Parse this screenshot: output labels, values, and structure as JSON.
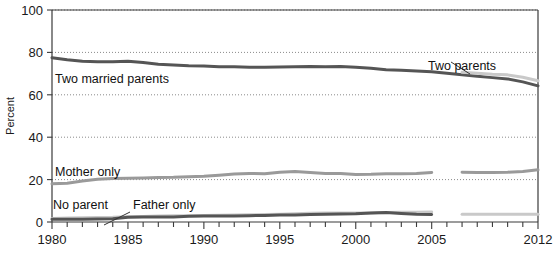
{
  "chart_data": {
    "type": "line",
    "title": "",
    "xlabel": "",
    "ylabel": "Percent",
    "xlim": [
      1980,
      2012
    ],
    "ylim": [
      0,
      100
    ],
    "yticks": [
      0,
      20,
      40,
      60,
      80,
      100
    ],
    "ytick_labels": [
      "0",
      "20",
      "40",
      "60",
      "80",
      "100"
    ],
    "xticks": [
      1980,
      1981,
      1982,
      1983,
      1984,
      1985,
      1986,
      1987,
      1988,
      1989,
      1990,
      1991,
      1992,
      1993,
      1994,
      1995,
      1996,
      1997,
      1998,
      1999,
      2000,
      2001,
      2002,
      2003,
      2004,
      2005,
      2006,
      2007,
      2008,
      2009,
      2010,
      2011,
      2012
    ],
    "xtick_labels": [
      "1980",
      "1985",
      "1990",
      "1995",
      "2000",
      "2005",
      "2012"
    ],
    "xtick_label_values": [
      1980,
      1985,
      1990,
      1995,
      2000,
      2005,
      2012
    ],
    "grid": "horizontal-dotted",
    "legend_position": "inline-annotations",
    "series": [
      {
        "name": "Two married parents",
        "color": "#555555",
        "width": 3,
        "x": [
          1980,
          1981,
          1982,
          1983,
          1984,
          1985,
          1986,
          1987,
          1988,
          1989,
          1990,
          1991,
          1992,
          1993,
          1994,
          1995,
          1996,
          1997,
          1998,
          1999,
          2000,
          2001,
          2002,
          2003,
          2004,
          2005,
          2006,
          2007,
          2008,
          2009,
          2010,
          2011,
          2012
        ],
        "values": [
          77.5,
          76.5,
          75.8,
          75.6,
          75.6,
          75.8,
          75.2,
          74.4,
          74.0,
          73.7,
          73.6,
          73.2,
          73.2,
          73.0,
          73.0,
          73.1,
          73.2,
          73.3,
          73.2,
          73.4,
          73.0,
          72.5,
          71.8,
          71.6,
          71.2,
          70.9,
          70.2,
          69.5,
          68.7,
          68.1,
          67.5,
          66.1,
          64.2
        ]
      },
      {
        "name": "Two parents",
        "color": "#c9c9c9",
        "width": 3,
        "x": [
          2007,
          2008,
          2009,
          2010,
          2011,
          2012
        ],
        "values": [
          70.6,
          70.2,
          69.7,
          69.4,
          68.3,
          66.6
        ]
      },
      {
        "name": "Mother only",
        "color": "#9a9a9a",
        "width": 3,
        "x": [
          1980,
          1981,
          1982,
          1983,
          1984,
          1985,
          1986,
          1987,
          1988,
          1989,
          1990,
          1991,
          1992,
          1993,
          1994,
          1995,
          1996,
          1997,
          1998,
          1999,
          2000,
          2001,
          2002,
          2003,
          2004,
          2005
        ],
        "values": [
          18.0,
          18.3,
          19.3,
          20.2,
          20.5,
          20.6,
          20.8,
          21.0,
          21.1,
          21.4,
          21.6,
          22.1,
          22.6,
          22.9,
          22.8,
          23.5,
          23.8,
          23.3,
          22.9,
          22.9,
          22.4,
          22.5,
          22.8,
          22.8,
          22.9,
          23.4
        ]
      },
      {
        "name": "Mother only (revised)",
        "color": "#9a9a9a",
        "width": 3,
        "x": [
          2007,
          2008,
          2009,
          2010,
          2011,
          2012
        ],
        "values": [
          23.5,
          23.4,
          23.4,
          23.5,
          23.8,
          24.6
        ]
      },
      {
        "name": "Father only",
        "color": "#c9c9c9",
        "width": 3,
        "x": [
          1980,
          1981,
          1982,
          1983,
          1984,
          1985,
          1986,
          1987,
          1988,
          1989,
          1990,
          1991,
          1992,
          1993,
          1994,
          1995,
          1996,
          1997,
          1998,
          1999,
          2000,
          2001,
          2002,
          2003,
          2004,
          2005
        ],
        "values": [
          1.7,
          1.9,
          2.0,
          2.1,
          2.2,
          2.5,
          2.6,
          2.8,
          2.9,
          3.0,
          3.1,
          3.2,
          3.3,
          3.4,
          3.5,
          3.7,
          3.9,
          4.1,
          4.2,
          4.2,
          4.2,
          4.3,
          4.5,
          4.6,
          4.6,
          4.7
        ]
      },
      {
        "name": "Father only (revised)",
        "color": "#c9c9c9",
        "width": 3,
        "x": [
          2007,
          2008,
          2009,
          2010,
          2011,
          2012
        ],
        "values": [
          3.6,
          3.6,
          3.6,
          3.6,
          3.6,
          3.6
        ]
      },
      {
        "name": "No parent",
        "color": "#555555",
        "width": 3,
        "x": [
          1980,
          1981,
          1982,
          1983,
          1984,
          1985,
          1986,
          1987,
          1988,
          1989,
          1990,
          1991,
          1992,
          1993,
          1994,
          1995,
          1996,
          1997,
          1998,
          1999,
          2000,
          2001,
          2002,
          2003,
          2004,
          2005
        ],
        "values": [
          1.3,
          1.3,
          1.3,
          1.4,
          1.5,
          2.2,
          2.3,
          2.3,
          2.4,
          2.7,
          2.8,
          2.8,
          2.8,
          3.0,
          3.1,
          3.3,
          3.3,
          3.5,
          3.6,
          3.8,
          3.9,
          4.2,
          4.5,
          4.0,
          3.6,
          3.5
        ]
      }
    ],
    "annotations": [
      {
        "text": "Two married parents",
        "x_px": 55,
        "y_px": 83,
        "anchor": "start"
      },
      {
        "text": "Two parents",
        "x_px": 428,
        "y_px": 70,
        "anchor": "start"
      },
      {
        "text": "Mother only",
        "x_px": 55,
        "y_px": 176,
        "anchor": "start"
      },
      {
        "text": "No parent",
        "x_px": 53,
        "y_px": 209,
        "anchor": "start"
      },
      {
        "text": "Father only",
        "x_px": 133,
        "y_px": 209,
        "anchor": "start"
      }
    ],
    "leader_lines": [
      {
        "from_px": [
          470,
          74
        ],
        "to_px": [
          451,
          62
        ]
      },
      {
        "from_px": [
          130,
          212
        ],
        "to_px": [
          104,
          225
        ]
      }
    ]
  }
}
